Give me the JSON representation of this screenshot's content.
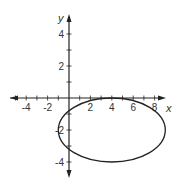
{
  "chart_data": {
    "type": "line",
    "title": "",
    "xlabel": "x",
    "ylabel": "y",
    "xlim": [
      -5,
      9
    ],
    "ylim": [
      -5,
      5
    ],
    "grid": false,
    "x_tick_labels": [
      "-4",
      "-2",
      "2",
      "4",
      "6",
      "8"
    ],
    "y_tick_labels": [
      "4",
      "2",
      "-2",
      "-4"
    ],
    "series": [
      {
        "name": "ellipse",
        "shape": "ellipse",
        "center": [
          4,
          -2
        ],
        "semi_axis_x": 5,
        "semi_axis_y": 2,
        "equation": "(x-4)^2/25 + (y+2)^2/4 = 1"
      }
    ]
  },
  "axes": {
    "x_label": "x",
    "y_label": "y",
    "x_ticks": [
      {
        "v": -4,
        "t": "-4"
      },
      {
        "v": -2,
        "t": "-2"
      },
      {
        "v": 2,
        "t": "2"
      },
      {
        "v": 4,
        "t": "4"
      },
      {
        "v": 6,
        "t": "6"
      },
      {
        "v": 8,
        "t": "8"
      }
    ],
    "y_ticks": [
      {
        "v": 4,
        "t": "4"
      },
      {
        "v": 2,
        "t": "2"
      },
      {
        "v": -2,
        "t": "-2"
      },
      {
        "v": -4,
        "t": "-4"
      }
    ]
  }
}
